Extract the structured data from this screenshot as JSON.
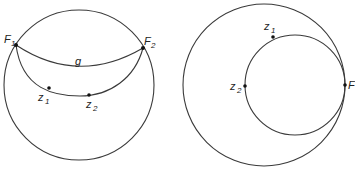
{
  "figures": {
    "left": {
      "outer_circle": {
        "cx": 79,
        "cy": 85,
        "r": 75
      },
      "arc_g": {
        "from": "F1",
        "to": "F2",
        "label": "g"
      },
      "arc_lower": {
        "from": "F1",
        "through": [
          "z1",
          "z2"
        ],
        "to": "F2"
      },
      "points": [
        {
          "id": "F1",
          "label": "F",
          "sub": "1",
          "x": 16,
          "y": 45
        },
        {
          "id": "F2",
          "label": "F",
          "sub": "2",
          "x": 143,
          "y": 48
        },
        {
          "id": "z1",
          "label": "z",
          "sub": "1",
          "x": 49,
          "y": 88
        },
        {
          "id": "z2",
          "label": "z",
          "sub": "2",
          "x": 89,
          "y": 95
        }
      ],
      "g_label": "g"
    },
    "right": {
      "outer_circle": {
        "cx": 264,
        "cy": 85,
        "r": 81
      },
      "inner_circle": {
        "cx": 295,
        "cy": 85,
        "r": 50
      },
      "points": [
        {
          "id": "z1",
          "label": "z",
          "sub": "1",
          "x": 273,
          "y": 37
        },
        {
          "id": "z2",
          "label": "z",
          "sub": "2",
          "x": 244,
          "y": 86
        },
        {
          "id": "F",
          "label": "F",
          "sub": "",
          "x": 345,
          "y": 85
        }
      ]
    }
  },
  "labels": {
    "F1": "F",
    "F1_sub": "1",
    "F2": "F",
    "F2_sub": "2",
    "g": "g",
    "lz1": "z",
    "lz1_sub": "1",
    "lz2": "z",
    "lz2_sub": "2",
    "rz1": "z",
    "rz1_sub": "1",
    "rz2": "z",
    "rz2_sub": "2",
    "rF": "F"
  }
}
